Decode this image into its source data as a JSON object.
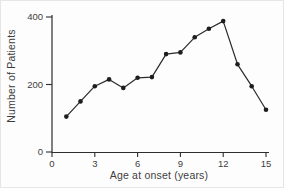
{
  "chart_data": {
    "type": "line",
    "title": "",
    "xlabel": "Age at onset (years)",
    "ylabel": "Number of Patients",
    "x": [
      1,
      2,
      3,
      4,
      5,
      6,
      7,
      8,
      9,
      10,
      11,
      12,
      13,
      14,
      15
    ],
    "values": [
      105,
      150,
      195,
      215,
      190,
      220,
      222,
      290,
      295,
      340,
      365,
      388,
      260,
      195,
      125
    ],
    "x_ticks": [
      0,
      3,
      6,
      9,
      12,
      15
    ],
    "y_ticks": [
      0,
      200,
      400
    ],
    "xlim": [
      0,
      15
    ],
    "ylim": [
      0,
      400
    ],
    "grid": "off",
    "legend": "none",
    "marker": "filled-circle",
    "line_color": "#2b2b2b",
    "marker_color": "#1d1d1d",
    "axis_color": "#2e2e2e",
    "text_color": "#3d3d3d"
  }
}
